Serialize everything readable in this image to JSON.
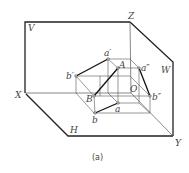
{
  "caption": "(a)",
  "colors": {
    "frame": "#222222",
    "thin": "#555555",
    "bold": "#111111",
    "text": "#444444"
  },
  "labels": {
    "V": "V",
    "Z": "Z",
    "W": "W",
    "X": "X",
    "H": "H",
    "Y": "Y",
    "O": "O",
    "a_prime": "a′",
    "b_prime": "b′",
    "A": "A",
    "a_dprime": "a″",
    "B": "B",
    "b_dprime": "b″",
    "a": "a",
    "b": "b"
  },
  "points": {
    "a_prime": [
      108,
      59
    ],
    "b_prime": [
      76,
      76
    ],
    "A": [
      118,
      68
    ],
    "B": [
      94,
      96
    ],
    "a_dprime": [
      139,
      68
    ],
    "b_dprime": [
      150,
      96
    ],
    "a": [
      118,
      103
    ],
    "b": [
      95,
      113
    ],
    "O": [
      131,
      93
    ]
  }
}
